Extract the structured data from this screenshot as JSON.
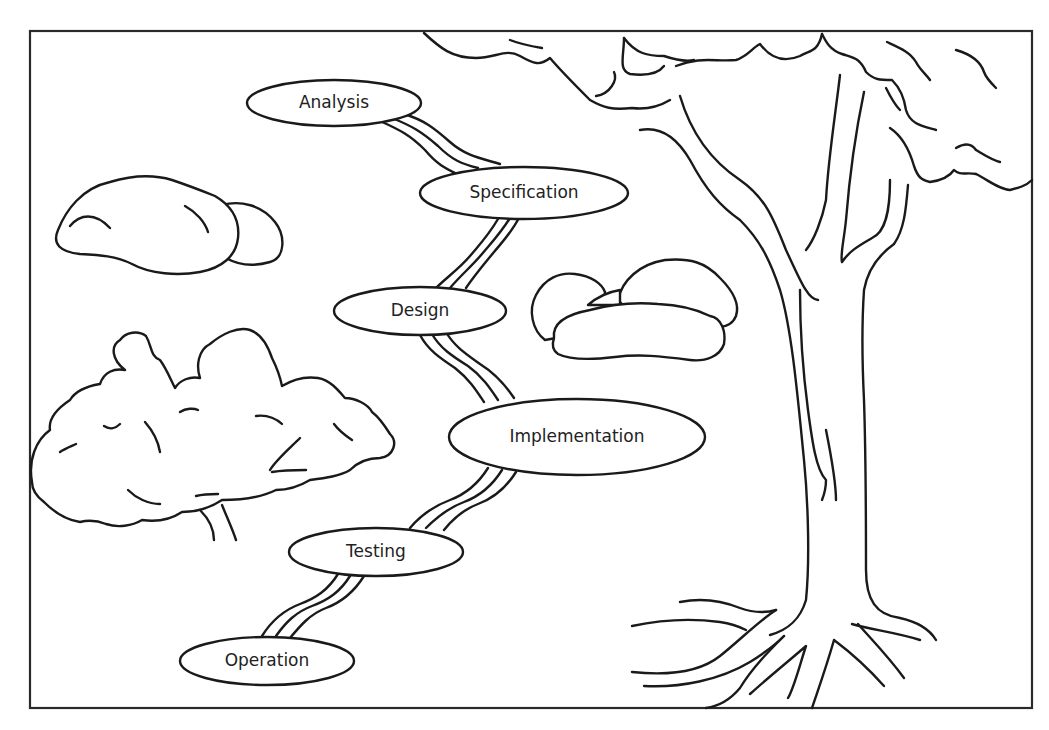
{
  "diagram": {
    "type": "waterfall-stream-metaphor",
    "phases": [
      {
        "label": "Analysis",
        "cx": 334,
        "cy": 103,
        "rx": 87,
        "ry": 23
      },
      {
        "label": "Specification",
        "cx": 524,
        "cy": 193,
        "rx": 104,
        "ry": 26
      },
      {
        "label": "Design",
        "cx": 420,
        "cy": 311,
        "rx": 86,
        "ry": 24
      },
      {
        "label": "Implementation",
        "cx": 577,
        "cy": 437,
        "rx": 128,
        "ry": 38
      },
      {
        "label": "Testing",
        "cx": 376,
        "cy": 552,
        "rx": 87,
        "ry": 24
      },
      {
        "label": "Operation",
        "cx": 267,
        "cy": 661,
        "rx": 87,
        "ry": 24
      }
    ],
    "flow": [
      "Analysis",
      "Specification",
      "Design",
      "Implementation",
      "Testing",
      "Operation"
    ],
    "scenery": [
      "tree",
      "bush",
      "rock-cluster-left",
      "rock-cluster-right",
      "stream"
    ],
    "colors": {
      "ink": "#1a1a1a",
      "background": "#ffffff",
      "frame": "#2a2a2a"
    }
  }
}
